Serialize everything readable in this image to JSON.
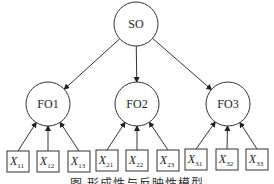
{
  "diagram": {
    "type": "hierarchical-measurement-model",
    "colors": {
      "stroke": "#333333",
      "text": "#222222",
      "background": "#ffffff"
    },
    "root": {
      "id": "SO",
      "label": "SO",
      "cx": 136,
      "cy": 24,
      "r": 22
    },
    "factors": [
      {
        "id": "FO1",
        "label": "FO1",
        "cx": 48,
        "cy": 104,
        "r": 22,
        "indicators": [
          {
            "id": "X11",
            "main": "X",
            "sub": "11",
            "x": 7,
            "y": 151
          },
          {
            "id": "X12",
            "main": "X",
            "sub": "12",
            "x": 37,
            "y": 151
          },
          {
            "id": "X13",
            "main": "X",
            "sub": "13",
            "x": 68,
            "y": 151
          }
        ]
      },
      {
        "id": "FO2",
        "label": "FO2",
        "cx": 137,
        "cy": 104,
        "r": 22,
        "indicators": [
          {
            "id": "X21",
            "main": "X",
            "sub": "21",
            "x": 96,
            "y": 150
          },
          {
            "id": "X22",
            "main": "X",
            "sub": "22",
            "x": 126,
            "y": 150
          },
          {
            "id": "X23",
            "main": "X",
            "sub": "23",
            "x": 157,
            "y": 150
          }
        ]
      },
      {
        "id": "FO3",
        "label": "FO3",
        "cx": 228,
        "cy": 104,
        "r": 22,
        "indicators": [
          {
            "id": "X31",
            "main": "X",
            "sub": "31",
            "x": 185,
            "y": 149
          },
          {
            "id": "X32",
            "main": "X",
            "sub": "32",
            "x": 216,
            "y": 149
          },
          {
            "id": "X33",
            "main": "X",
            "sub": "33",
            "x": 246,
            "y": 149
          }
        ]
      }
    ],
    "edges": {
      "root_to_factors": "arrow from SO to each FO",
      "indicators_to_factors": "arrow from each X to its FO"
    },
    "box": {
      "w": 22,
      "h": 21
    }
  },
  "caption": "图      形成性与反映性模型"
}
